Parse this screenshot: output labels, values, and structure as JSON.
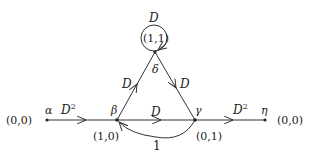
{
  "diagram": {
    "type": "state-transition-graph",
    "nodes": {
      "alpha": {
        "symbol": "α",
        "coord": "(0,0)"
      },
      "beta": {
        "symbol": "β",
        "coord": "(1,0)"
      },
      "gamma": {
        "symbol": "γ",
        "coord": "(0,1)"
      },
      "delta": {
        "symbol": "δ",
        "coord": "(1,1)"
      },
      "eta": {
        "symbol": "η",
        "coord": "(0,0)"
      }
    },
    "edges": {
      "alpha_beta": {
        "label_base": "D",
        "label_sup": "2"
      },
      "beta_delta": {
        "label": "D"
      },
      "delta_gamma": {
        "label": "D"
      },
      "delta_loop": {
        "label": "D"
      },
      "beta_gamma": {
        "label": "D"
      },
      "gamma_beta": {
        "label": "1"
      },
      "gamma_eta": {
        "label_base": "D",
        "label_sup": "2"
      }
    }
  }
}
